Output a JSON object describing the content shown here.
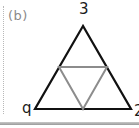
{
  "figure": {
    "panel_label": "(b)",
    "vertex_labels": {
      "top": "3",
      "bottom_left": "q",
      "bottom_right": "2"
    },
    "outer_triangle": {
      "stroke": "#111111",
      "points": [
        [
          83,
          26
        ],
        [
          35,
          109
        ],
        [
          131,
          109
        ]
      ]
    },
    "inner_triangle": {
      "stroke": "#8c8c8c",
      "points": [
        [
          59,
          67
        ],
        [
          107,
          67
        ],
        [
          83,
          109
        ]
      ]
    }
  }
}
